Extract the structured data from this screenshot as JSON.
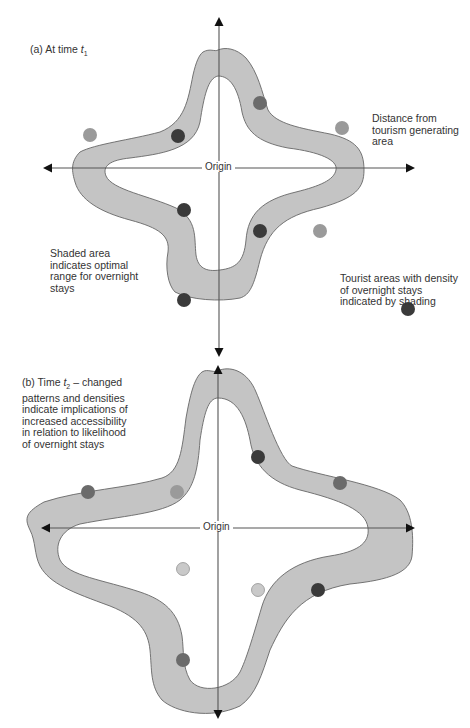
{
  "panel_a": {
    "title_prefix": "(a) At time ",
    "title_var": "t",
    "title_sub": "1",
    "origin_label": "Origin",
    "annotations": {
      "distance": "Distance from tourism generating area",
      "shaded": "Shaded area indicates optimal range for overnight stays",
      "tourist_areas": "Tourist areas with density of overnight stays indicated by shading"
    },
    "points": [
      {
        "x": 260,
        "y": 103,
        "shade": "mid"
      },
      {
        "x": 178,
        "y": 136,
        "shade": "dark"
      },
      {
        "x": 90,
        "y": 135,
        "shade": "light"
      },
      {
        "x": 342,
        "y": 128,
        "shade": "light"
      },
      {
        "x": 184,
        "y": 210,
        "shade": "dark"
      },
      {
        "x": 260,
        "y": 231,
        "shade": "dark"
      },
      {
        "x": 320,
        "y": 231,
        "shade": "light"
      },
      {
        "x": 184,
        "y": 300,
        "shade": "dark"
      },
      {
        "x": 408,
        "y": 309,
        "shade": "dark"
      }
    ]
  },
  "panel_b": {
    "title_prefix": "(b) Time ",
    "title_var": "t",
    "title_sub": "2",
    "title_rest": " – changed patterns and densities indicate implications of increased accessibility in relation to likelihood of overnight stays",
    "origin_label": "Origin",
    "points": [
      {
        "x": 258,
        "y": 457,
        "shade": "dark"
      },
      {
        "x": 340,
        "y": 483,
        "shade": "mid"
      },
      {
        "x": 88,
        "y": 492,
        "shade": "mid"
      },
      {
        "x": 177,
        "y": 492,
        "shade": "light"
      },
      {
        "x": 183,
        "y": 569,
        "shade": "pale"
      },
      {
        "x": 258,
        "y": 590,
        "shade": "pale"
      },
      {
        "x": 318,
        "y": 590,
        "shade": "dark"
      },
      {
        "x": 183,
        "y": 660,
        "shade": "mid"
      }
    ]
  }
}
